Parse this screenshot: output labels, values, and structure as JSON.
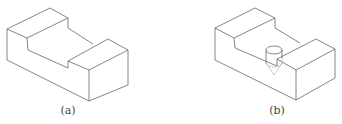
{
  "figures": [
    {
      "id": "a",
      "label": "(a)",
      "description": "Isometric block with rectangular slot cut through the top"
    },
    {
      "id": "b",
      "label": "(b)",
      "description": "Same slotted block with a cylindrical drilled hole (cone tip) in slot floor"
    }
  ],
  "colors": {
    "line": "#666666",
    "hidden_line": "#999999",
    "background": "#ffffff"
  }
}
